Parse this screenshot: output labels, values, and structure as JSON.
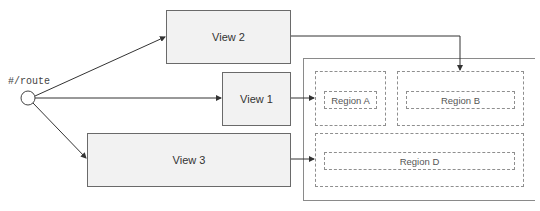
{
  "diagram": {
    "route": {
      "label": "#/route"
    },
    "views": [
      {
        "id": "view2",
        "label": "View 2"
      },
      {
        "id": "view1",
        "label": "View 1"
      },
      {
        "id": "view3",
        "label": "View 3"
      }
    ],
    "regions": [
      {
        "id": "regionA",
        "label": "Region A"
      },
      {
        "id": "regionB",
        "label": "Region B"
      },
      {
        "id": "regionD",
        "label": "Region D"
      }
    ],
    "colors": {
      "line": "#333333",
      "view_fill": "#f2f2f2",
      "view_border": "#6a6a6a",
      "region_border": "#8f8f8f"
    }
  }
}
